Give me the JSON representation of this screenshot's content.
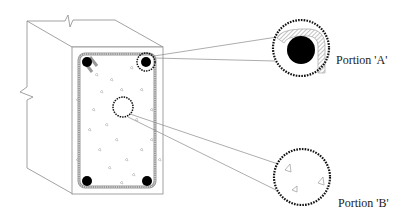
{
  "diagram": {
    "type": "reinforced-concrete-beam-cross-section",
    "labels": {
      "portion_a": "Portion 'A'",
      "portion_b": "Portion 'B'"
    },
    "colors": {
      "line": "#7a7a7a",
      "rebar": "#000000",
      "dashed": "#111111",
      "stirrup_hatch": "#888888",
      "aggregate": "#999999"
    },
    "rebars": [
      {
        "cx": 87,
        "cy": 62
      },
      {
        "cx": 146,
        "cy": 62
      },
      {
        "cx": 87,
        "cy": 181
      },
      {
        "cx": 147,
        "cy": 181
      }
    ]
  }
}
